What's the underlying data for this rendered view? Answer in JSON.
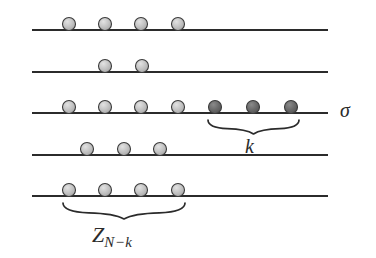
{
  "figure": {
    "background_color": "#ffffff",
    "width": 376,
    "height": 258,
    "line_color": "#2b2b2b",
    "light_bead_color": "#bcbcbc",
    "dark_bead_color": "#666666",
    "bead_outline_color": "#3a3a3a",
    "bead_radius": 6.5,
    "line_start_x": 32,
    "line_end_x": 328
  },
  "labels": {
    "sigma": "σ",
    "k": "k",
    "z_base": "Z",
    "z_subscript": "N−k"
  },
  "chart_data": {
    "type": "scatter",
    "xlabel": "",
    "ylabel": "",
    "grid": false,
    "legend": "none",
    "xlim": [
      32,
      328
    ],
    "rows": [
      {
        "index": 1,
        "line_y": 30,
        "beads": [
          {
            "x": 69,
            "shade": "light"
          },
          {
            "x": 105,
            "shade": "light"
          },
          {
            "x": 141,
            "shade": "light"
          },
          {
            "x": 178,
            "shade": "light"
          }
        ]
      },
      {
        "index": 2,
        "line_y": 72,
        "beads": [
          {
            "x": 105,
            "shade": "light"
          },
          {
            "x": 142,
            "shade": "light"
          }
        ]
      },
      {
        "index": 3,
        "line_y": 113,
        "beads": [
          {
            "x": 69,
            "shade": "light"
          },
          {
            "x": 105,
            "shade": "light"
          },
          {
            "x": 141,
            "shade": "light"
          },
          {
            "x": 178,
            "shade": "light"
          },
          {
            "x": 215,
            "shade": "dark"
          },
          {
            "x": 253,
            "shade": "dark"
          },
          {
            "x": 291,
            "shade": "dark"
          }
        ]
      },
      {
        "index": 4,
        "line_y": 155,
        "beads": [
          {
            "x": 87,
            "shade": "light"
          },
          {
            "x": 124,
            "shade": "light"
          },
          {
            "x": 160,
            "shade": "light"
          }
        ]
      },
      {
        "index": 5,
        "line_y": 196,
        "beads": [
          {
            "x": 69,
            "shade": "light"
          },
          {
            "x": 105,
            "shade": "light"
          },
          {
            "x": 141,
            "shade": "light"
          },
          {
            "x": 178,
            "shade": "light"
          }
        ]
      }
    ],
    "braces": [
      {
        "name": "k",
        "left_x": 208,
        "right_x": 299,
        "top_y": 120,
        "depth": 14,
        "label": "k"
      },
      {
        "name": "z",
        "left_x": 63,
        "right_x": 185,
        "top_y": 203,
        "depth": 16,
        "label": "Z N−k"
      }
    ]
  }
}
